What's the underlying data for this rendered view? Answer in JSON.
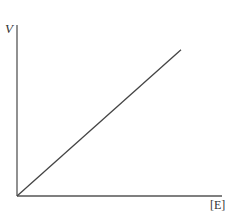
{
  "chart_data": {
    "type": "line",
    "title": "",
    "xlabel": "[E]",
    "ylabel": "V",
    "grid": false,
    "legend": null,
    "ticks": {
      "x": [],
      "y": []
    },
    "series": [
      {
        "name": "V vs [E]",
        "x": [
          0,
          1
        ],
        "values": [
          0,
          1
        ]
      }
    ],
    "xlim": [
      0,
      1.25
    ],
    "ylim": [
      0,
      1.17
    ],
    "annotations": []
  },
  "colors": {
    "axis": "#555555",
    "line": "#444444",
    "background": "#ffffff"
  }
}
